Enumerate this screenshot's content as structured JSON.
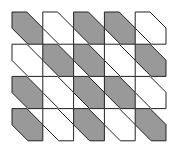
{
  "diagram": {
    "type": "tiling-pattern",
    "rows": 4,
    "cols": 5,
    "origin": [
      12,
      12
    ],
    "cell_width": 30.8,
    "cell_height": 32.2,
    "corner_cut": 16,
    "colors": {
      "shaded": "#999999",
      "unshaded": "#ffffff",
      "stroke": "#222222",
      "background": "#ffffff"
    },
    "pattern": [
      [
        1,
        0,
        1,
        1,
        0
      ],
      [
        0,
        1,
        1,
        0,
        1
      ],
      [
        1,
        0,
        1,
        1,
        0
      ],
      [
        1,
        0,
        1,
        0,
        1
      ]
    ]
  }
}
